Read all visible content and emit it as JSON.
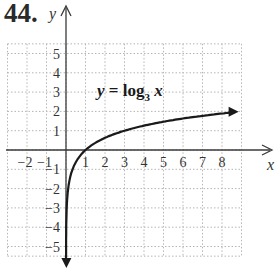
{
  "problem": {
    "number": "44."
  },
  "chart_data": {
    "type": "line",
    "title": "",
    "equation_label": {
      "lhs": "y = ",
      "func": "log",
      "base": "3",
      "arg": " x"
    },
    "xlabel": "x",
    "ylabel": "y",
    "x_ticks": [
      "−2",
      "−1",
      "1",
      "2",
      "3",
      "4",
      "5",
      "6",
      "7",
      "8"
    ],
    "y_ticks": [
      "5",
      "4",
      "3",
      "2",
      "1",
      "−1",
      "−2",
      "−3",
      "−4",
      "−5"
    ],
    "xlim": [
      -3,
      10
    ],
    "ylim": [
      -6,
      6
    ],
    "grid": true,
    "legend": "none",
    "series": [
      {
        "name": "y = log3 x",
        "x": [
          0.01,
          0.05,
          0.1,
          0.2,
          0.333,
          0.5,
          1,
          2,
          3,
          4,
          5,
          6,
          7,
          8,
          9
        ],
        "y": [
          -4.19,
          -2.73,
          -2.1,
          -1.46,
          -1.0,
          -0.63,
          0,
          0.63,
          1.0,
          1.26,
          1.46,
          1.63,
          1.77,
          1.89,
          2.0
        ]
      }
    ],
    "colors": {
      "curve": "#1a1a1a",
      "axes": "#3a3a3a",
      "grid": "#b5b5b5"
    }
  }
}
